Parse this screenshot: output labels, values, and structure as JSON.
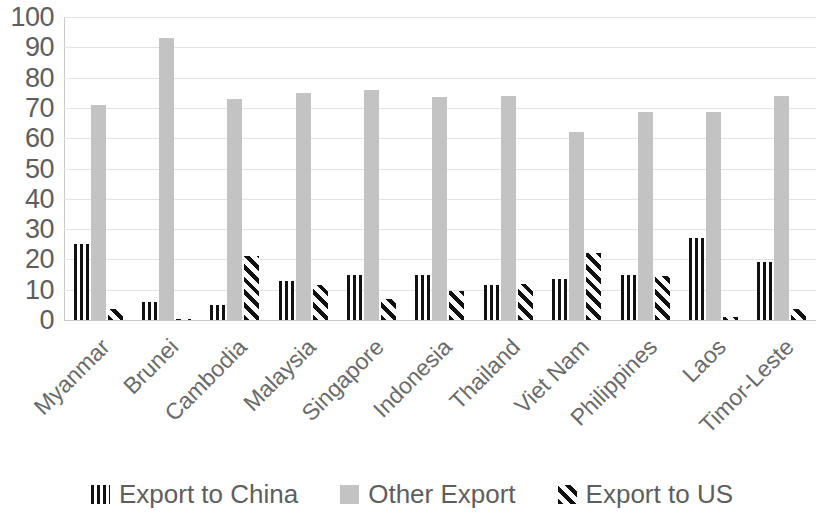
{
  "chart_data": {
    "type": "bar",
    "title": "",
    "subtitle": "",
    "xlabel": "",
    "ylabel": "",
    "ylim": [
      0,
      100
    ],
    "ytick_step": 10,
    "yticks": [
      "100",
      "90",
      "80",
      "70",
      "60",
      "50",
      "40",
      "30",
      "20",
      "10",
      "0"
    ],
    "grid": true,
    "legend_position": "bottom",
    "categories": [
      "Myanmar",
      "Brunei",
      "Cambodia",
      "Malaysia",
      "Singapore",
      "Indonesia",
      "Thailand",
      "Viet Nam",
      "Philippines",
      "Laos",
      "Timor-Leste"
    ],
    "series": [
      {
        "name": "Export to China",
        "pattern": "vertical-stripes",
        "color": "#111111",
        "values": [
          25,
          6,
          5,
          13,
          15,
          15,
          11.5,
          13.5,
          15,
          27,
          19
        ]
      },
      {
        "name": "Other Export",
        "pattern": "solid",
        "color": "#c3c3c3",
        "values": [
          71,
          93,
          73,
          75,
          76,
          73.5,
          74,
          62,
          68.5,
          68.5,
          74
        ]
      },
      {
        "name": "Export to US",
        "pattern": "diagonal-stripes",
        "color": "#111111",
        "values": [
          3.5,
          0.5,
          21,
          11.5,
          7,
          9.5,
          12,
          22,
          14.5,
          1,
          3.5
        ]
      }
    ]
  },
  "legend": {
    "items": [
      {
        "label": "Export to China",
        "swatch": "sw-china"
      },
      {
        "label": "Other Export",
        "swatch": "sw-other"
      },
      {
        "label": "Export to US",
        "swatch": "sw-us"
      }
    ]
  }
}
